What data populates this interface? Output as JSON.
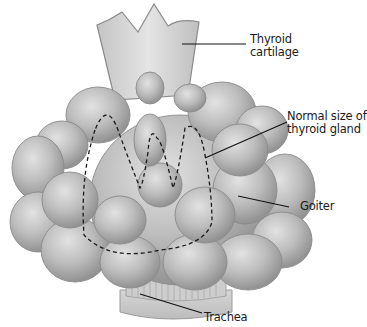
{
  "figure": {
    "labels": {
      "thyroid_cartilage": [
        "Thyroid",
        "cartilage"
      ],
      "normal_size": [
        "Normal size of",
        "thyroid gland"
      ],
      "goiter": "Goiter",
      "trachea": "Trachea"
    },
    "colors": {
      "gland_fill": "#b9b9b9",
      "gland_highlight": "#dcdcdc",
      "gland_shadow": "#8f8f8f",
      "cartilage_fill": "#cfcfcf",
      "outline": "#7a7a7a",
      "dashed_outline": "#1a1a1a",
      "leader_line": "#111111",
      "background": "#ffffff"
    }
  }
}
